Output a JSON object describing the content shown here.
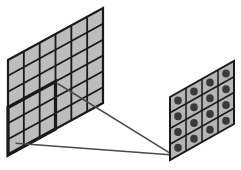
{
  "diagram": {
    "type": "convolution-receptive-field",
    "input_grid": {
      "rows": 6,
      "cols": 6,
      "cell_fill": "#bdbdbd",
      "line_color": "#1a1a1a"
    },
    "receptive_field": {
      "rows": 3,
      "cols": 3,
      "position": "bottom-left",
      "line_color": "#1a1a1a"
    },
    "output_grid": {
      "rows": 4,
      "cols": 4,
      "cell_fill": "#b5b5b5",
      "dot_color": "#3a3a3a",
      "line_color": "#1a1a1a"
    },
    "connector_color": "#4a4a4a"
  }
}
